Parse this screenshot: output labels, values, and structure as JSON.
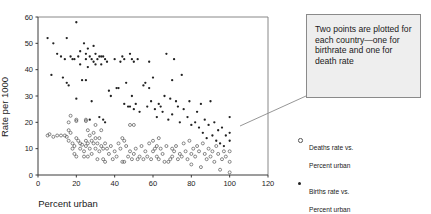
{
  "chart_data": {
    "type": "scatter",
    "title": "",
    "xlabel": "Percent urban",
    "ylabel": "Rate per 1000",
    "xlim": [
      0,
      120
    ],
    "ylim": [
      0,
      60
    ],
    "xticks": [
      0,
      20,
      40,
      60,
      80,
      100,
      120
    ],
    "yticks": [
      0,
      10,
      20,
      30,
      40,
      50,
      60
    ],
    "grid": false,
    "legend_position": "right-outside",
    "series": [
      {
        "name": "Deaths rate vs. Percent urban",
        "marker": "open-circle",
        "color": "#555555",
        "points": [
          [
            5,
            15
          ],
          [
            6,
            15.5
          ],
          [
            8,
            14.5
          ],
          [
            10,
            15
          ],
          [
            12,
            15
          ],
          [
            14,
            15
          ],
          [
            15,
            14.5
          ],
          [
            16,
            20
          ],
          [
            16,
            17
          ],
          [
            16,
            13
          ],
          [
            17,
            22.5
          ],
          [
            17,
            16
          ],
          [
            18,
            12
          ],
          [
            18,
            10
          ],
          [
            19,
            11
          ],
          [
            19,
            8
          ],
          [
            20,
            21
          ],
          [
            20,
            20.5
          ],
          [
            20,
            14
          ],
          [
            20,
            7
          ],
          [
            21,
            13
          ],
          [
            22,
            12
          ],
          [
            22,
            10
          ],
          [
            23,
            11.5
          ],
          [
            24,
            9
          ],
          [
            24,
            7
          ],
          [
            25,
            21
          ],
          [
            25,
            20.5
          ],
          [
            25,
            13
          ],
          [
            25,
            11
          ],
          [
            26,
            17
          ],
          [
            26,
            12
          ],
          [
            26,
            7
          ],
          [
            27,
            15
          ],
          [
            27,
            10
          ],
          [
            28,
            13
          ],
          [
            28,
            8
          ],
          [
            29,
            16
          ],
          [
            29,
            12
          ],
          [
            30,
            19
          ],
          [
            30,
            14
          ],
          [
            30,
            10
          ],
          [
            31,
            12
          ],
          [
            31,
            6
          ],
          [
            32,
            14
          ],
          [
            32,
            9
          ],
          [
            33,
            17
          ],
          [
            33,
            11
          ],
          [
            34,
            10
          ],
          [
            34,
            6
          ],
          [
            35,
            12
          ],
          [
            35,
            5
          ],
          [
            36,
            10
          ],
          [
            37,
            8
          ],
          [
            38,
            11
          ],
          [
            39,
            6
          ],
          [
            40,
            9
          ],
          [
            41,
            7
          ],
          [
            42,
            12
          ],
          [
            43,
            10
          ],
          [
            44,
            14
          ],
          [
            44,
            5
          ],
          [
            45,
            13
          ],
          [
            45,
            5
          ],
          [
            46,
            11
          ],
          [
            47,
            7
          ],
          [
            48,
            19
          ],
          [
            48,
            9
          ],
          [
            49,
            6
          ],
          [
            50,
            19
          ],
          [
            50,
            8
          ],
          [
            51,
            10
          ],
          [
            52,
            6
          ],
          [
            53,
            7
          ],
          [
            54,
            11
          ],
          [
            55,
            6
          ],
          [
            56,
            9
          ],
          [
            57,
            7
          ],
          [
            58,
            12
          ],
          [
            59,
            6
          ],
          [
            60,
            13
          ],
          [
            60,
            9
          ],
          [
            61,
            10
          ],
          [
            62,
            11
          ],
          [
            62,
            7
          ],
          [
            63,
            14
          ],
          [
            63,
            6
          ],
          [
            64,
            10
          ],
          [
            65,
            8
          ],
          [
            66,
            5
          ],
          [
            67,
            11
          ],
          [
            68,
            5
          ],
          [
            69,
            6
          ],
          [
            70,
            10
          ],
          [
            70,
            7
          ],
          [
            71,
            9
          ],
          [
            72,
            11
          ],
          [
            73,
            6
          ],
          [
            74,
            8
          ],
          [
            75,
            7
          ],
          [
            76,
            12
          ],
          [
            77,
            9
          ],
          [
            78,
            6
          ],
          [
            79,
            13
          ],
          [
            80,
            8
          ],
          [
            80,
            4
          ],
          [
            81,
            10
          ],
          [
            82,
            7
          ],
          [
            83,
            11
          ],
          [
            84,
            9
          ],
          [
            85,
            3
          ],
          [
            86,
            12
          ],
          [
            87,
            8
          ],
          [
            88,
            6
          ],
          [
            89,
            10
          ],
          [
            90,
            7
          ],
          [
            91,
            9
          ],
          [
            92,
            5
          ],
          [
            93,
            11
          ],
          [
            94,
            8
          ],
          [
            95,
            2
          ],
          [
            96,
            6
          ],
          [
            97,
            9
          ],
          [
            98,
            7
          ],
          [
            100,
            9
          ],
          [
            100,
            5
          ],
          [
            100,
            1
          ]
        ]
      },
      {
        "name": "Births rate vs. Percent urban",
        "marker": "filled-circle",
        "color": "#222222",
        "points": [
          [
            5,
            52
          ],
          [
            7,
            38
          ],
          [
            8,
            50
          ],
          [
            10,
            46
          ],
          [
            12,
            45
          ],
          [
            13,
            37
          ],
          [
            14,
            44
          ],
          [
            15,
            52
          ],
          [
            15,
            35
          ],
          [
            16,
            34
          ],
          [
            17,
            45
          ],
          [
            18,
            44
          ],
          [
            19,
            44
          ],
          [
            20,
            58
          ],
          [
            20,
            29
          ],
          [
            21,
            45
          ],
          [
            22,
            47
          ],
          [
            22,
            42
          ],
          [
            23,
            36
          ],
          [
            24,
            50
          ],
          [
            25,
            46
          ],
          [
            25,
            44
          ],
          [
            25,
            36
          ],
          [
            26,
            48
          ],
          [
            26,
            41
          ],
          [
            27,
            45
          ],
          [
            27,
            21
          ],
          [
            28,
            44
          ],
          [
            28,
            28
          ],
          [
            29,
            49
          ],
          [
            29,
            43
          ],
          [
            30,
            46
          ],
          [
            30,
            42
          ],
          [
            31,
            44
          ],
          [
            32,
            45
          ],
          [
            32,
            22
          ],
          [
            33,
            45
          ],
          [
            33,
            42
          ],
          [
            34,
            45
          ],
          [
            34,
            21
          ],
          [
            35,
            44
          ],
          [
            35,
            20
          ],
          [
            36,
            43
          ],
          [
            37,
            32
          ],
          [
            38,
            30
          ],
          [
            40,
            44
          ],
          [
            41,
            33
          ],
          [
            42,
            33
          ],
          [
            43,
            43
          ],
          [
            44,
            45
          ],
          [
            45,
            44
          ],
          [
            45,
            27
          ],
          [
            46,
            35
          ],
          [
            47,
            26
          ],
          [
            48,
            46
          ],
          [
            48,
            26
          ],
          [
            49,
            44
          ],
          [
            49,
            30
          ],
          [
            50,
            43
          ],
          [
            50,
            25
          ],
          [
            51,
            27
          ],
          [
            52,
            44
          ],
          [
            53,
            24
          ],
          [
            55,
            34
          ],
          [
            56,
            35
          ],
          [
            57,
            26
          ],
          [
            58,
            43
          ],
          [
            58,
            33
          ],
          [
            59,
            28
          ],
          [
            60,
            37
          ],
          [
            61,
            25
          ],
          [
            62,
            22
          ],
          [
            63,
            27
          ],
          [
            64,
            26
          ],
          [
            65,
            24
          ],
          [
            66,
            30
          ],
          [
            67,
            46
          ],
          [
            68,
            21
          ],
          [
            69,
            29
          ],
          [
            70,
            36
          ],
          [
            70,
            23
          ],
          [
            71,
            44
          ],
          [
            72,
            28
          ],
          [
            73,
            26
          ],
          [
            74,
            20
          ],
          [
            75,
            38
          ],
          [
            76,
            25
          ],
          [
            78,
            22
          ],
          [
            79,
            28
          ],
          [
            80,
            19
          ],
          [
            82,
            20
          ],
          [
            83,
            24
          ],
          [
            84,
            18
          ],
          [
            85,
            27
          ],
          [
            86,
            16
          ],
          [
            87,
            21
          ],
          [
            88,
            14
          ],
          [
            89,
            19
          ],
          [
            90,
            28
          ],
          [
            91,
            15
          ],
          [
            92,
            20
          ],
          [
            93,
            13
          ],
          [
            94,
            17
          ],
          [
            95,
            12
          ],
          [
            96,
            18
          ],
          [
            97,
            11
          ],
          [
            98,
            15
          ],
          [
            100,
            22
          ],
          [
            100,
            16
          ],
          [
            100,
            13
          ]
        ]
      }
    ]
  },
  "annotation": {
    "text": "Two points are plotted for each country—one for birthrate and one for death rate"
  },
  "legend": {
    "entries": [
      {
        "label": "Deaths rate vs.\nPercent urban",
        "marker": "open-circle"
      },
      {
        "label": "Births rate vs.\nPercent urban",
        "marker": "filled-circle"
      }
    ]
  },
  "colors": {
    "axis": "#7a7a7a",
    "deaths_marker": "#555555",
    "births_marker": "#222222",
    "annotation_fill": "#eeeeee",
    "annotation_border": "#8a8a8a",
    "leader_line": "#8a8a8a"
  }
}
